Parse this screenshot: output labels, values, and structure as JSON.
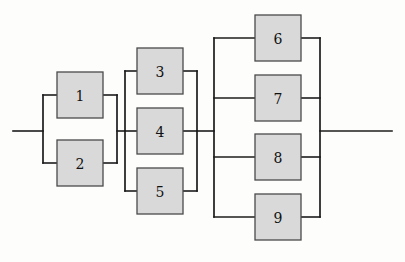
{
  "diagram": {
    "type": "reliability-block-diagram",
    "title": "",
    "background_color": "#fdfdfc",
    "block_fill_color": "#d9d9d9",
    "block_border_color": "#4a4a4a",
    "wire_color": "#1c1c1c",
    "blocks": [
      {
        "id": "block-1",
        "label": "1",
        "x": 57,
        "y": 72,
        "w": 46,
        "h": 46,
        "group": "group-a"
      },
      {
        "id": "block-2",
        "label": "2",
        "x": 57,
        "y": 140,
        "w": 46,
        "h": 46,
        "group": "group-a"
      },
      {
        "id": "block-3",
        "label": "3",
        "x": 137,
        "y": 48,
        "w": 46,
        "h": 46,
        "group": "group-b"
      },
      {
        "id": "block-4",
        "label": "4",
        "x": 137,
        "y": 108,
        "w": 46,
        "h": 46,
        "group": "group-b"
      },
      {
        "id": "block-5",
        "label": "5",
        "x": 137,
        "y": 168,
        "w": 46,
        "h": 46,
        "group": "group-b"
      },
      {
        "id": "block-6",
        "label": "6",
        "x": 255,
        "y": 15,
        "w": 46,
        "h": 46,
        "group": "group-c"
      },
      {
        "id": "block-7",
        "label": "7",
        "x": 255,
        "y": 75,
        "w": 46,
        "h": 46,
        "group": "group-c"
      },
      {
        "id": "block-8",
        "label": "8",
        "x": 255,
        "y": 134,
        "w": 46,
        "h": 46,
        "group": "group-c"
      },
      {
        "id": "block-9",
        "label": "9",
        "x": 255,
        "y": 194,
        "w": 46,
        "h": 46,
        "group": "group-c"
      }
    ],
    "groups": [
      {
        "id": "group-a",
        "members": [
          "1",
          "2"
        ],
        "left_bus_x": 43,
        "right_bus_x": 117,
        "top_y": 95,
        "bottom_y": 163
      },
      {
        "id": "group-b",
        "members": [
          "3",
          "4",
          "5"
        ],
        "left_bus_x": 125,
        "right_bus_x": 197,
        "top_y": 71,
        "bottom_y": 191
      },
      {
        "id": "group-c",
        "members": [
          "6",
          "7",
          "8",
          "9"
        ],
        "left_bus_x": 214,
        "right_bus_x": 320,
        "top_y": 38,
        "bottom_y": 217
      }
    ],
    "main_line_y": 131,
    "input_wire": {
      "x1": 13,
      "x2": 43,
      "y": 131
    },
    "link_a_to_b": {
      "x1": 117,
      "x2": 125,
      "y": 131
    },
    "link_b_to_c": {
      "x1": 197,
      "x2": 214,
      "y": 131
    },
    "output_wire": {
      "x1": 320,
      "x2": 392,
      "y": 131
    }
  }
}
